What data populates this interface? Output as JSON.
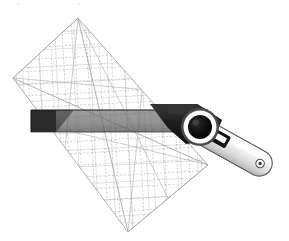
{
  "illustration": {
    "title": "Rotary cutter guided along a gridded quilting ruler",
    "subject": "quilting-tools",
    "background_color": "#ffffff",
    "canvas": {
      "width": 289,
      "height": 241
    }
  },
  "ruler": {
    "name": "gridded quilting ruler",
    "shape": "rectangle",
    "rotation_degrees": 42,
    "corner_points": "78,18 208,165 128,232 13,78",
    "fill_color": "#ffffff",
    "fill_opacity": 0.0,
    "outline_color": "#9a9a9a",
    "outline_width": 0.8,
    "grid": {
      "line_color": "#a8a8a8",
      "line_width": 0.7,
      "spacing_px": 17,
      "diagonal_color": "#9e9e9e",
      "diagonal_dash": "2,2",
      "diagonal_width": 0.7
    }
  },
  "cutter": {
    "name": "rotary cutter",
    "body_color": "#1c1c1c",
    "body_highlight_color": "#3a3a3a",
    "handle_color": "#e8e8e8",
    "handle_shadow_color": "#b9b9b9",
    "handle_outline_color": "#4a4a4a",
    "blade_ring_color": "#ffffff",
    "blade_hub_color": "#0d0d0d",
    "blade_outer_color": "#4a4a4a",
    "hang_hole_color": "#ffffff",
    "switch_slot_color": "#141414",
    "switch_knob_color": "#ffffff",
    "angle_degrees": 29
  },
  "guide_bar": {
    "name": "ruler edge guide bar",
    "solid_color": "#2b2b2b",
    "translucent_color": "#6f6f6f",
    "translucent_opacity": 0.72,
    "edge_color": "#151515",
    "left_x": 31,
    "right_x": 205,
    "top_y": 110,
    "height": 22
  },
  "labels": {
    "alt_text": "Illustration of a transparent square quilting ruler printed with a grid and diagonal guide lines, rotated on the diagonal, with a rotary cutter running along the ruler's straight edge."
  }
}
